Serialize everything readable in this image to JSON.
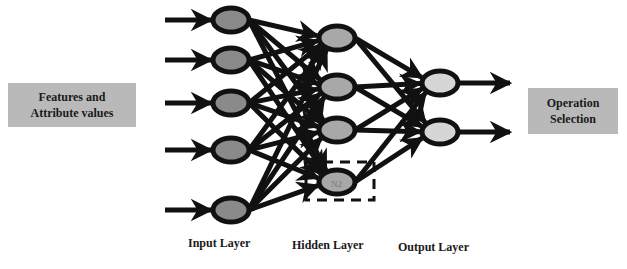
{
  "diagram": {
    "input_box": {
      "line1": "Features and",
      "line2": "Attribute values"
    },
    "output_box": {
      "line1": "Operation",
      "line2": "Selection"
    },
    "layer_labels": {
      "input": "Input Layer",
      "hidden": "Hidden Layer",
      "output": "Output Layer"
    },
    "highlighted_node_label": "N2",
    "colors": {
      "input_node": "#8a8a8a",
      "hidden_node": "#a8a8a8",
      "output_node": "#d6d6d6",
      "box": "#b9b9b9",
      "edge": "#111111"
    },
    "layers": {
      "input": {
        "count": 5,
        "nodes": [
          [
            231,
            20
          ],
          [
            231,
            60
          ],
          [
            231,
            103
          ],
          [
            231,
            150
          ],
          [
            231,
            210
          ]
        ]
      },
      "hidden": {
        "count": 4,
        "nodes": [
          [
            337,
            38
          ],
          [
            337,
            87
          ],
          [
            337,
            130
          ],
          [
            337,
            182
          ]
        ]
      },
      "output": {
        "count": 2,
        "nodes": [
          [
            440,
            83
          ],
          [
            440,
            132
          ]
        ]
      }
    }
  }
}
